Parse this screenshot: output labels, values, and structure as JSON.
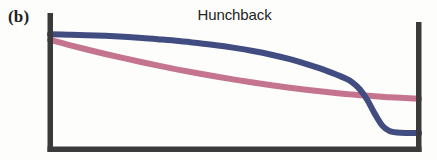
{
  "figure": {
    "panel_label": "(b)",
    "title": "Hunchback",
    "background_color": "#fdfdfc",
    "axis_color": "#3a3a3a",
    "width": 437,
    "height": 160
  },
  "chart_data": {
    "type": "line",
    "title": "Hunchback",
    "subtitle": "",
    "xlabel": "",
    "ylabel": "",
    "xlim": [
      0,
      1
    ],
    "ylim": [
      0,
      1
    ],
    "grid": false,
    "legend": "none",
    "axes_style": "left-bottom-right spines, thick dark bars, no tick labels",
    "annotations": [
      {
        "text": "(b)",
        "position": "outside-top-left"
      },
      {
        "text": "Hunchback",
        "position": "top-center"
      }
    ],
    "x": [
      0.0,
      0.05,
      0.1,
      0.15,
      0.2,
      0.25,
      0.3,
      0.35,
      0.4,
      0.45,
      0.5,
      0.55,
      0.6,
      0.65,
      0.7,
      0.75,
      0.8,
      0.82,
      0.84,
      0.86,
      0.88,
      0.9,
      0.92,
      0.95,
      1.0
    ],
    "series": [
      {
        "name": "hunchback-blue",
        "color": "#414d80",
        "width": 6,
        "values": [
          0.885,
          0.882,
          0.878,
          0.872,
          0.864,
          0.855,
          0.843,
          0.83,
          0.814,
          0.796,
          0.775,
          0.75,
          0.72,
          0.684,
          0.64,
          0.59,
          0.53,
          0.495,
          0.44,
          0.355,
          0.245,
          0.15,
          0.105,
          0.09,
          0.088
        ]
      },
      {
        "name": "hunchback-pink",
        "color": "#c4748f",
        "width": 6,
        "values": [
          0.84,
          0.8,
          0.762,
          0.726,
          0.692,
          0.659,
          0.628,
          0.598,
          0.57,
          0.544,
          0.519,
          0.496,
          0.474,
          0.454,
          0.436,
          0.419,
          0.404,
          0.399,
          0.394,
          0.389,
          0.385,
          0.381,
          0.377,
          0.372,
          0.365
        ]
      }
    ]
  }
}
